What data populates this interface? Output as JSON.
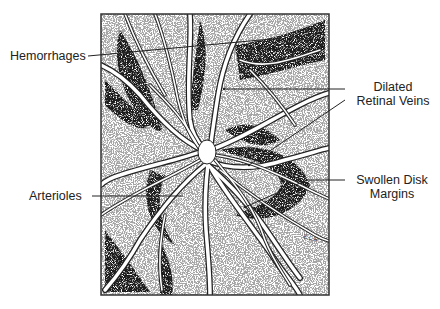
{
  "diagram": {
    "labels": [
      {
        "id": "hemorrhages",
        "text": "Hemorrhages"
      },
      {
        "id": "dilated-retinal-veins",
        "line1": "Dilated",
        "line2": "Retinal Veins"
      },
      {
        "id": "swollen-disk-margins",
        "line1": "Swollen Disk",
        "line2": "Margins"
      },
      {
        "id": "arterioles",
        "text": "Arterioles"
      }
    ],
    "signature": "E.L.R."
  }
}
